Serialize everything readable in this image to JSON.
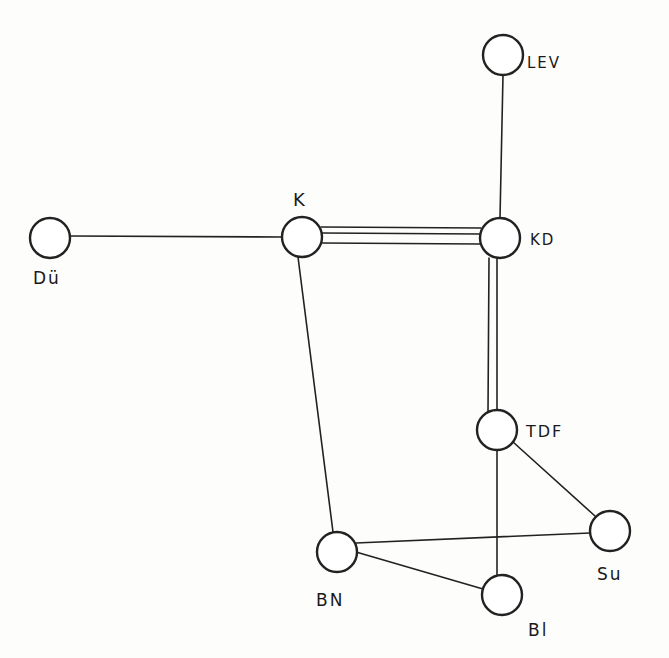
{
  "diagram": {
    "type": "network-graph",
    "style": "hand-drawn",
    "colors": {
      "stroke": "#222222",
      "background": "#fdfdfc",
      "node_fill": "#ffffff"
    },
    "nodes": [
      {
        "id": "LEV",
        "label": "LEV",
        "x": 503,
        "y": 55,
        "r": 20
      },
      {
        "id": "Du",
        "label": "Dü",
        "x": 50,
        "y": 238,
        "r": 20
      },
      {
        "id": "K",
        "label": "K",
        "x": 302,
        "y": 237,
        "r": 20
      },
      {
        "id": "KD",
        "label": "KD",
        "x": 500,
        "y": 238,
        "r": 20
      },
      {
        "id": "TDF",
        "label": "TDF",
        "x": 497,
        "y": 430,
        "r": 20
      },
      {
        "id": "Su",
        "label": "Su",
        "x": 610,
        "y": 531,
        "r": 20
      },
      {
        "id": "BN",
        "label": "BN",
        "x": 337,
        "y": 552,
        "r": 20
      },
      {
        "id": "Bl",
        "label": "Bl",
        "x": 502,
        "y": 595,
        "r": 20
      }
    ],
    "edges": [
      {
        "from": "LEV",
        "to": "KD",
        "multiplicity": 1
      },
      {
        "from": "Du",
        "to": "K",
        "multiplicity": 1
      },
      {
        "from": "K",
        "to": "KD",
        "multiplicity": 3
      },
      {
        "from": "KD",
        "to": "TDF",
        "multiplicity": 2
      },
      {
        "from": "K",
        "to": "BN",
        "multiplicity": 1
      },
      {
        "from": "TDF",
        "to": "Su",
        "multiplicity": 1
      },
      {
        "from": "TDF",
        "to": "Bl",
        "multiplicity": 1
      },
      {
        "from": "BN",
        "to": "Su",
        "multiplicity": 1
      },
      {
        "from": "BN",
        "to": "Bl",
        "multiplicity": 1
      }
    ],
    "labels": {
      "LEV": {
        "text": "LEV",
        "x": 527,
        "y": 68
      },
      "Du": {
        "text": "Dü",
        "x": 33,
        "y": 284
      },
      "K": {
        "text": "K",
        "x": 293,
        "y": 206
      },
      "KD": {
        "text": "KD",
        "x": 530,
        "y": 245
      },
      "TDF": {
        "text": "TDF",
        "x": 526,
        "y": 437
      },
      "Su": {
        "text": "Su",
        "x": 597,
        "y": 580
      },
      "BN": {
        "text": "BN",
        "x": 316,
        "y": 606
      },
      "Bl": {
        "text": "Bl",
        "x": 528,
        "y": 636
      }
    }
  }
}
